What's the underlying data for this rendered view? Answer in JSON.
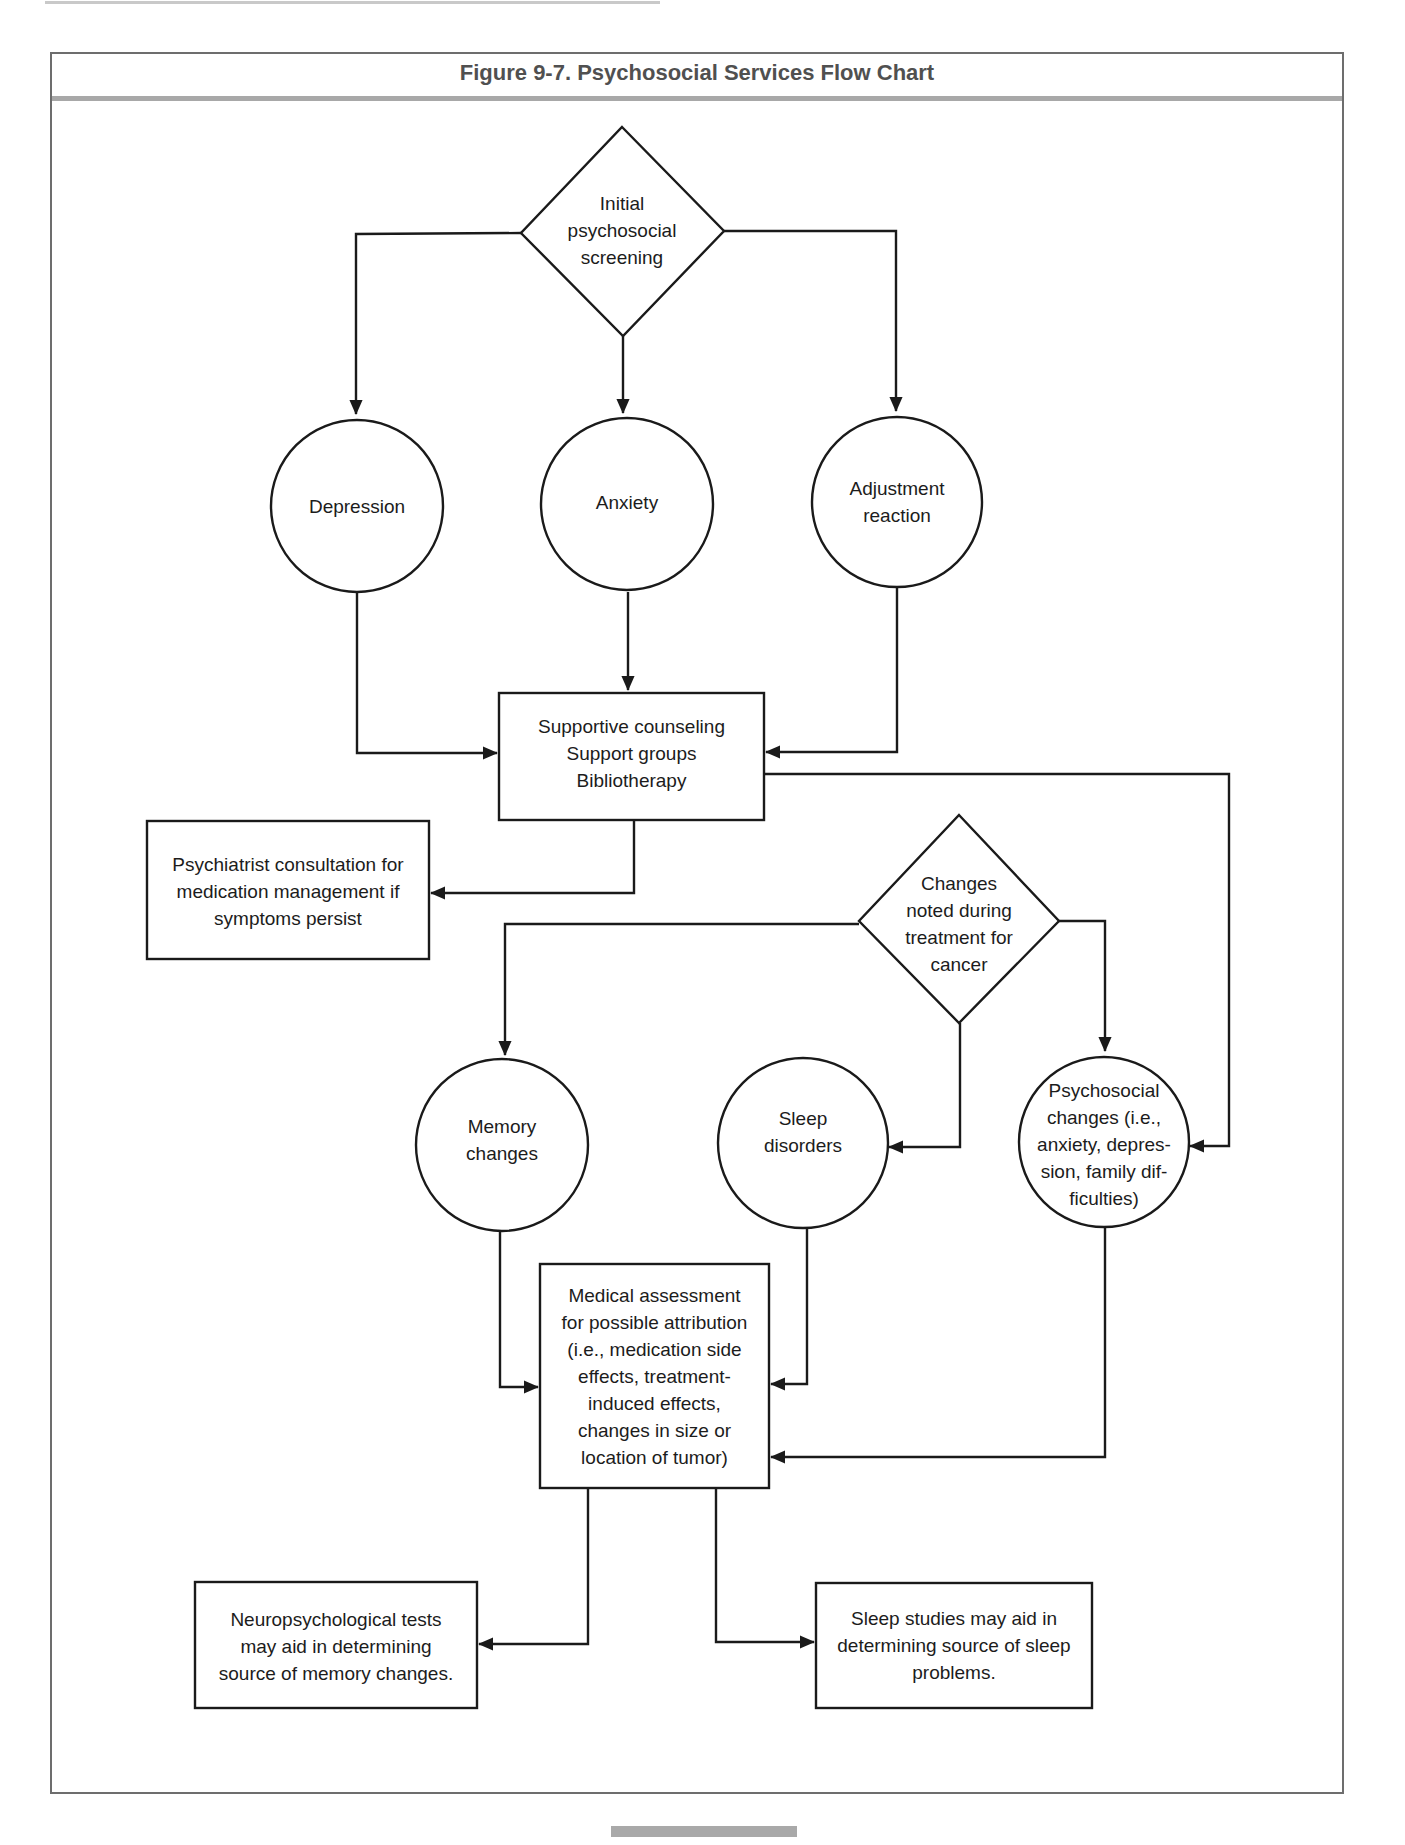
{
  "figure": {
    "title": "Figure 9-7. Psychosocial Services Flow Chart"
  },
  "nodes": {
    "initial_screening": {
      "shape": "diamond",
      "text": "Initial\npsychosocial\nscreening"
    },
    "depression": {
      "shape": "circle",
      "text": "Depression"
    },
    "anxiety": {
      "shape": "circle",
      "text": "Anxiety"
    },
    "adjustment_reaction": {
      "shape": "circle",
      "text": "Adjustment\nreaction"
    },
    "supportive_services": {
      "shape": "rectangle",
      "text": "Supportive counseling\nSupport groups\nBibliotherapy"
    },
    "psychiatrist_consultation": {
      "shape": "rectangle",
      "text": "Psychiatrist consultation for\nmedication management if\nsymptoms persist"
    },
    "changes_during_treatment": {
      "shape": "diamond",
      "text": "Changes\nnoted during\ntreatment for\ncancer"
    },
    "memory_changes": {
      "shape": "circle",
      "text": "Memory\nchanges"
    },
    "sleep_disorders": {
      "shape": "circle",
      "text": "Sleep\ndisorders"
    },
    "psychosocial_changes": {
      "shape": "circle",
      "text": "Psychosocial\nchanges (i.e.,\nanxiety, depres-\nsion, family dif-\nficulties)"
    },
    "medical_assessment": {
      "shape": "rectangle",
      "text": "Medical assessment\nfor possible attribution\n(i.e., medication side\neffects, treatment-\ninduced effects,\nchanges in size or\nlocation of tumor)"
    },
    "neuropsych_tests": {
      "shape": "rectangle",
      "text": "Neuropsychological tests\nmay aid in determining\nsource of memory changes."
    },
    "sleep_studies": {
      "shape": "rectangle",
      "text": "Sleep studies may aid in\ndetermining source of sleep\nproblems."
    }
  },
  "edges": [
    {
      "from": "initial_screening",
      "to": "depression"
    },
    {
      "from": "initial_screening",
      "to": "anxiety"
    },
    {
      "from": "initial_screening",
      "to": "adjustment_reaction"
    },
    {
      "from": "depression",
      "to": "supportive_services"
    },
    {
      "from": "anxiety",
      "to": "supportive_services"
    },
    {
      "from": "adjustment_reaction",
      "to": "supportive_services"
    },
    {
      "from": "supportive_services",
      "to": "psychiatrist_consultation"
    },
    {
      "from": "supportive_services",
      "to": "psychosocial_changes"
    },
    {
      "from": "changes_during_treatment",
      "to": "memory_changes"
    },
    {
      "from": "changes_during_treatment",
      "to": "sleep_disorders"
    },
    {
      "from": "changes_during_treatment",
      "to": "psychosocial_changes"
    },
    {
      "from": "memory_changes",
      "to": "medical_assessment"
    },
    {
      "from": "sleep_disorders",
      "to": "medical_assessment"
    },
    {
      "from": "psychosocial_changes",
      "to": "medical_assessment"
    },
    {
      "from": "medical_assessment",
      "to": "neuropsych_tests"
    },
    {
      "from": "medical_assessment",
      "to": "sleep_studies"
    }
  ],
  "colors": {
    "stroke": "#1a1a1a",
    "frame": "#6d6d6d",
    "title_text": "#505050",
    "title_rule": "#a8a8a8"
  }
}
